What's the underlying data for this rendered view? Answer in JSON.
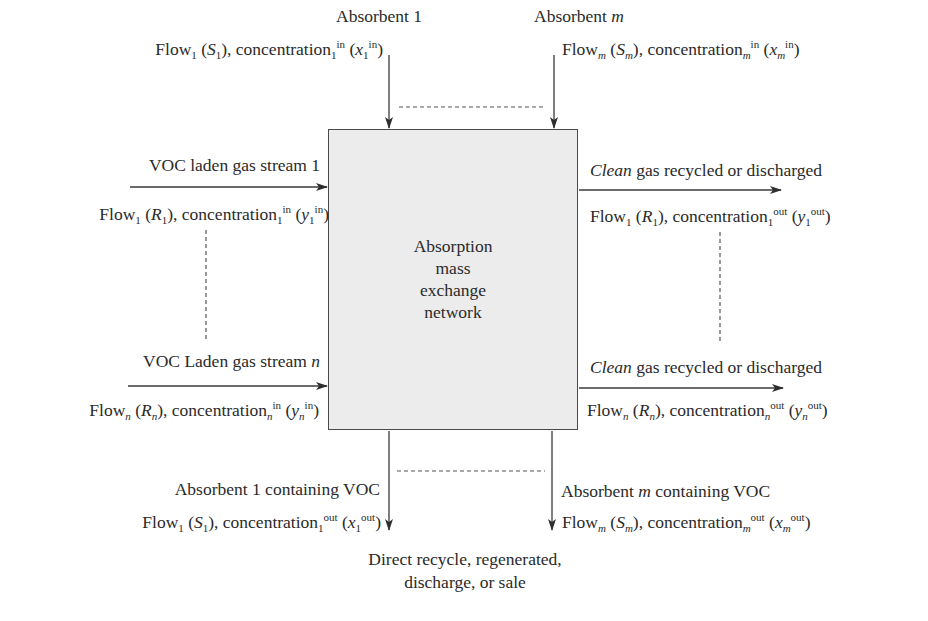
{
  "diagram": {
    "center_box": {
      "lines": [
        "Absorption",
        "mass",
        "exchange",
        "network"
      ],
      "fill": "#ececec"
    },
    "absorbent_inputs": [
      {
        "name_prefix": "Absorbent ",
        "name_index": "1",
        "flow": "Flow",
        "flow_sub": "1",
        "flow_sym": "S",
        "flow_sym_sub": "1",
        "conc": "concentration",
        "conc_sub": "1",
        "conc_sup": "in",
        "conc_sym": "x",
        "conc_sym_sub": "1",
        "conc_sym_sup": "in"
      },
      {
        "name_prefix": "Absorbent ",
        "name_index": "m",
        "flow": "Flow",
        "flow_sub": "m",
        "flow_sym": "S",
        "flow_sym_sub": "m",
        "conc": "concentration",
        "conc_sub": "m",
        "conc_sup": "in",
        "conc_sym": "x",
        "conc_sym_sub": "m",
        "conc_sym_sup": "in"
      }
    ],
    "gas_inputs": [
      {
        "name_prefix": "VOC laden gas stream ",
        "name_index": "1",
        "flow": "Flow",
        "flow_sub": "1",
        "flow_sym": "R",
        "flow_sym_sub": "1",
        "conc": "concentration",
        "conc_sub": "1",
        "conc_sup": "in",
        "conc_sym": "y",
        "conc_sym_sub": "1",
        "conc_sym_sup": "in"
      },
      {
        "name_prefix": "VOC Laden gas stream ",
        "name_index": "n",
        "flow": "Flow",
        "flow_sub": "n",
        "flow_sym": "R",
        "flow_sym_sub": "n",
        "conc": "concentration",
        "conc_sub": "n",
        "conc_sup": "in",
        "conc_sym": "y",
        "conc_sym_sub": "n",
        "conc_sym_sup": "in"
      }
    ],
    "gas_outputs": [
      {
        "name_italic": "Clean",
        "name_rest": " gas recycled or discharged",
        "flow": "Flow",
        "flow_sub": "1",
        "flow_sym": "R",
        "flow_sym_sub": "1",
        "conc": "concentration",
        "conc_sub": "1",
        "conc_sup": "out",
        "conc_sym": "y",
        "conc_sym_sub": "1",
        "conc_sym_sup": "out"
      },
      {
        "name_italic": "Clean",
        "name_rest": " gas recycled or discharged",
        "flow": "Flow",
        "flow_sub": "n",
        "flow_sym": "R",
        "flow_sym_sub": "n",
        "conc": "concentration",
        "conc_sub": "n",
        "conc_sup": "out",
        "conc_sym": "y",
        "conc_sym_sub": "n",
        "conc_sym_sup": "out"
      }
    ],
    "absorbent_outputs": [
      {
        "name_prefix": "Absorbent ",
        "name_index": "1",
        "name_suffix": " containing VOC",
        "flow": "Flow",
        "flow_sub": "1",
        "flow_sym": "S",
        "flow_sym_sub": "1",
        "conc": "concentration",
        "conc_sub": "1",
        "conc_sup": "out",
        "conc_sym": "x",
        "conc_sym_sub": "1",
        "conc_sym_sup": "out"
      },
      {
        "name_prefix": "Absorbent ",
        "name_index": "m",
        "name_suffix": " containing VOC",
        "flow": "Flow",
        "flow_sub": "m",
        "flow_sym": "S",
        "flow_sym_sub": "m",
        "conc": "concentration",
        "conc_sub": "m",
        "conc_sup": "out",
        "conc_sym": "x",
        "conc_sym_sub": "m",
        "conc_sym_sup": "out"
      }
    ],
    "destination": {
      "line1": "Direct recycle, regenerated,",
      "line2": "discharge, or sale"
    },
    "punct": {
      "open": " (",
      "close": "), ",
      "open2": " (",
      "close2": ")"
    },
    "colors": {
      "line": "#3a3a3a",
      "text": "#2a2a2a",
      "box_border": "#4a4a4a"
    }
  }
}
